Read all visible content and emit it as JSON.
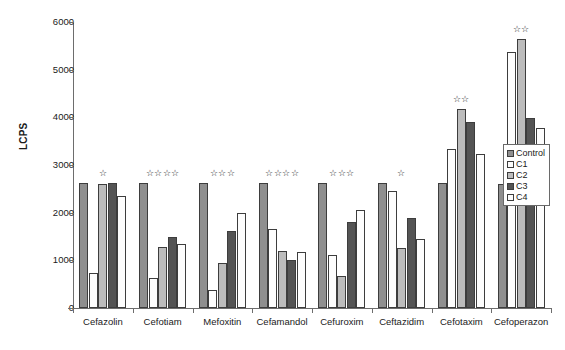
{
  "chart_data": {
    "type": "bar",
    "title": "",
    "xlabel": "",
    "ylabel": "LCPS",
    "ylim": [
      0,
      6000
    ],
    "ytick_labels": [
      "6000",
      "5000",
      "4000",
      "3000",
      "2000",
      "1000",
      "0"
    ],
    "yticks": [
      6000,
      5000,
      4000,
      3000,
      2000,
      1000,
      0
    ],
    "grid": false,
    "legend_position": "right",
    "categories": [
      "Cefazolin",
      "Cefotiam",
      "Mefoxitin",
      "Cefamandol",
      "Cefuroxim",
      "Ceftazidim",
      "Cefotaxim",
      "Cefoperazon"
    ],
    "series": [
      {
        "name": "Control",
        "color": "#8f8f8f",
        "values": [
          2630,
          2630,
          2630,
          2630,
          2630,
          2630,
          2620,
          2610
        ]
      },
      {
        "name": "C1",
        "color": "#fdfdfd",
        "values": [
          730,
          620,
          370,
          1660,
          1110,
          2450,
          3340,
          5380
        ]
      },
      {
        "name": "C2",
        "color": "#bcbcbc",
        "values": [
          2600,
          1270,
          950,
          1190,
          680,
          1260,
          4180,
          5650
        ]
      },
      {
        "name": "C3",
        "color": "#545454",
        "values": [
          2620,
          1500,
          1620,
          1010,
          1810,
          1880,
          3910,
          3990
        ]
      },
      {
        "name": "C4",
        "color": "#fdfdfd",
        "values": [
          2340,
          1340,
          2000,
          1180,
          2050,
          1450,
          3230,
          3780
        ]
      }
    ],
    "annotations": {
      "label": "significance-stars",
      "glyph": "☆",
      "counts": [
        1,
        4,
        3,
        4,
        3,
        1,
        2,
        2
      ]
    }
  },
  "legend": {
    "items": [
      {
        "label": "Control",
        "color": "#8f8f8f"
      },
      {
        "label": "C1",
        "color": "#fdfdfd"
      },
      {
        "label": "C2",
        "color": "#bcbcbc"
      },
      {
        "label": "C3",
        "color": "#545454"
      },
      {
        "label": "C4",
        "color": "#fdfdfd"
      }
    ]
  }
}
